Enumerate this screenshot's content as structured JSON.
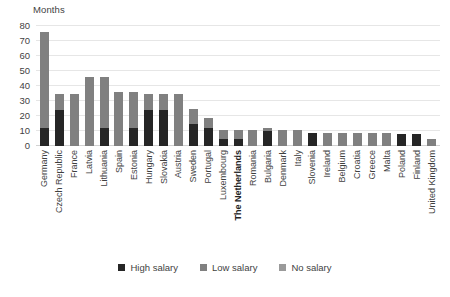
{
  "chart_data": {
    "type": "bar",
    "title": "",
    "ylabel": "Months",
    "xlabel": "",
    "ylim": [
      0,
      80
    ],
    "ytick_values": [
      0,
      10,
      20,
      30,
      40,
      50,
      60,
      70,
      80
    ],
    "ytick_labels": [
      "0",
      "10",
      "20",
      "30",
      "40",
      "50",
      "60",
      "70",
      "80"
    ],
    "grid": true,
    "stacked": true,
    "legend_position": "bottom",
    "categories": [
      "Germany",
      "Czech Republic",
      "France",
      "Latvia",
      "Lithuania",
      "Spain",
      "Estonia",
      "Hungary",
      "Slovakia",
      "Austria",
      "Sweden",
      "Portugal",
      "Luxembourg",
      "The Netherlands",
      "Romania",
      "Bulgaria",
      "Denmark",
      "Italy",
      "Slovenia",
      "Ireland",
      "Belgium",
      "Croatia",
      "Greece",
      "Malta",
      "Poland",
      "Finland",
      "United Kingdom"
    ],
    "highlight_category": "The Netherlands",
    "series": [
      {
        "name": "High salary",
        "color": "#262626",
        "values": [
          12,
          24,
          0,
          0,
          12,
          0,
          12,
          24,
          24,
          0,
          15,
          12,
          5,
          5,
          0,
          10,
          0,
          0,
          9,
          0,
          0,
          0,
          0,
          0,
          8,
          8,
          0
        ]
      },
      {
        "name": "Low salary",
        "color": "#808080",
        "values": [
          64,
          11,
          35,
          46,
          34,
          36,
          24,
          11,
          11,
          35,
          10,
          7,
          6,
          6,
          11,
          2,
          11,
          11,
          0,
          9,
          9,
          9,
          9,
          9,
          0,
          0,
          5
        ]
      },
      {
        "name": "No salary",
        "color": "#9a9a9a",
        "values": [
          0,
          0,
          0,
          0,
          0,
          0,
          0,
          0,
          0,
          0,
          0,
          0,
          0,
          0,
          0,
          0,
          0,
          0,
          0,
          0,
          0,
          0,
          0,
          0,
          0,
          0,
          0
        ]
      }
    ],
    "totals": [
      76,
      35,
      35,
      46,
      46,
      36,
      36,
      35,
      35,
      35,
      25,
      19,
      11,
      11,
      11,
      12,
      11,
      11,
      9,
      9,
      9,
      9,
      9,
      9,
      8,
      8,
      5
    ]
  },
  "legend": {
    "items": [
      {
        "label": "High salary",
        "color": "#262626"
      },
      {
        "label": "Low salary",
        "color": "#808080"
      },
      {
        "label": "No salary",
        "color": "#9a9a9a"
      }
    ]
  }
}
